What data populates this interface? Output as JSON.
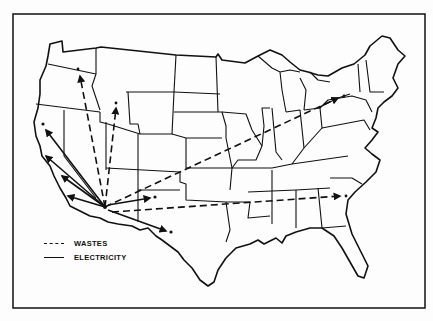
{
  "figure": {
    "type": "map",
    "hub": {
      "x": 105,
      "y": 207
    }
  },
  "legend": {
    "items": [
      {
        "style": "dashed",
        "label": "WASTES"
      },
      {
        "style": "solid",
        "label": "ELECTRICITY"
      }
    ]
  },
  "flows": {
    "wastes": [
      {
        "to": "Washington (Hanford)",
        "x": 79,
        "y": 73
      },
      {
        "to": "Idaho",
        "x": 116,
        "y": 105
      },
      {
        "to": "Northeast (Lake Ontario area)",
        "x": 340,
        "y": 97
      },
      {
        "to": "South Carolina",
        "x": 342,
        "y": 196
      },
      {
        "to": "New Mexico",
        "x": 152,
        "y": 200
      }
    ],
    "electricity": [
      {
        "to": "Northern California",
        "x": 44,
        "y": 128
      },
      {
        "to": "San Francisco Bay",
        "x": 44,
        "y": 155
      },
      {
        "to": "Central California",
        "x": 60,
        "y": 175
      },
      {
        "to": "Southern California",
        "x": 68,
        "y": 197
      },
      {
        "to": "Texas (El Paso)",
        "x": 168,
        "y": 232
      }
    ]
  },
  "colors": {
    "ink": "#111111",
    "paper": "#fdfdfd"
  }
}
